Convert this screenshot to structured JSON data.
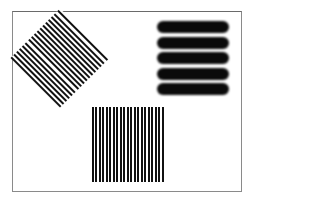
{
  "figure": {
    "frame_color": "#8a8a8a",
    "background_color": "#ffffff",
    "stimuli": [
      {
        "name": "diagonal-grating",
        "orientation_deg": 45,
        "stripe_count": 24,
        "shape": "diamond",
        "stripe_color": "#111111"
      },
      {
        "name": "horizontal-bars",
        "orientation_deg": 0,
        "stripe_count": 5,
        "shape": "rectangle",
        "stripe_color": "#0a0a0a"
      },
      {
        "name": "vertical-grating",
        "orientation_deg": 90,
        "stripe_count": 21,
        "shape": "square",
        "stripe_color": "#111111"
      }
    ]
  }
}
